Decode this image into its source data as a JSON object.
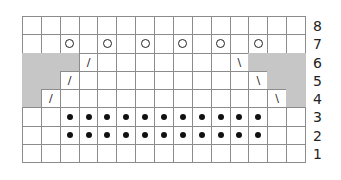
{
  "chart_data": {
    "type": "table",
    "title": "",
    "columns": 15,
    "rows": 8,
    "row_labels": [
      "8",
      "7",
      "6",
      "5",
      "4",
      "3",
      "2",
      "1"
    ],
    "row_labels_position": "right",
    "legend_symbols": {
      "blank": "knit",
      "O": "yarn over",
      "•": "purl",
      "/": "k2tog",
      "\\": "ssk",
      "gray": "no stitch"
    },
    "grid": [
      {
        "row": 8,
        "cells": [
          "",
          "",
          "",
          "",
          "",
          "",
          "",
          "",
          "",
          "",
          "",
          "",
          "",
          "",
          ""
        ]
      },
      {
        "row": 7,
        "cells": [
          "",
          "",
          "O",
          "",
          "O",
          "",
          "O",
          "",
          "O",
          "",
          "O",
          "",
          "O",
          "",
          ""
        ]
      },
      {
        "row": 6,
        "cells": [
          "gray",
          "gray",
          "gray",
          "/",
          "",
          "",
          "",
          "",
          "",
          "",
          "",
          "\\",
          "gray",
          "gray",
          "gray"
        ]
      },
      {
        "row": 5,
        "cells": [
          "gray",
          "gray",
          "/",
          "",
          "",
          "",
          "",
          "",
          "",
          "",
          "",
          "",
          "\\",
          "gray",
          "gray"
        ]
      },
      {
        "row": 4,
        "cells": [
          "gray",
          "/",
          "",
          "",
          "",
          "",
          "",
          "",
          "",
          "",
          "",
          "",
          "",
          "\\",
          "gray"
        ]
      },
      {
        "row": 3,
        "cells": [
          "",
          "",
          "•",
          "•",
          "•",
          "•",
          "•",
          "•",
          "•",
          "•",
          "•",
          "•",
          "•",
          "",
          ""
        ]
      },
      {
        "row": 2,
        "cells": [
          "",
          "",
          "•",
          "•",
          "•",
          "•",
          "•",
          "•",
          "•",
          "•",
          "•",
          "•",
          "•",
          "",
          ""
        ]
      },
      {
        "row": 1,
        "cells": [
          "",
          "",
          "",
          "",
          "",
          "",
          "",
          "",
          "",
          "",
          "",
          "",
          "",
          "",
          ""
        ]
      }
    ]
  },
  "colors": {
    "grid_line": "#8c8c8c",
    "no_stitch": "#c6c6c6",
    "symbol": "#111111"
  }
}
